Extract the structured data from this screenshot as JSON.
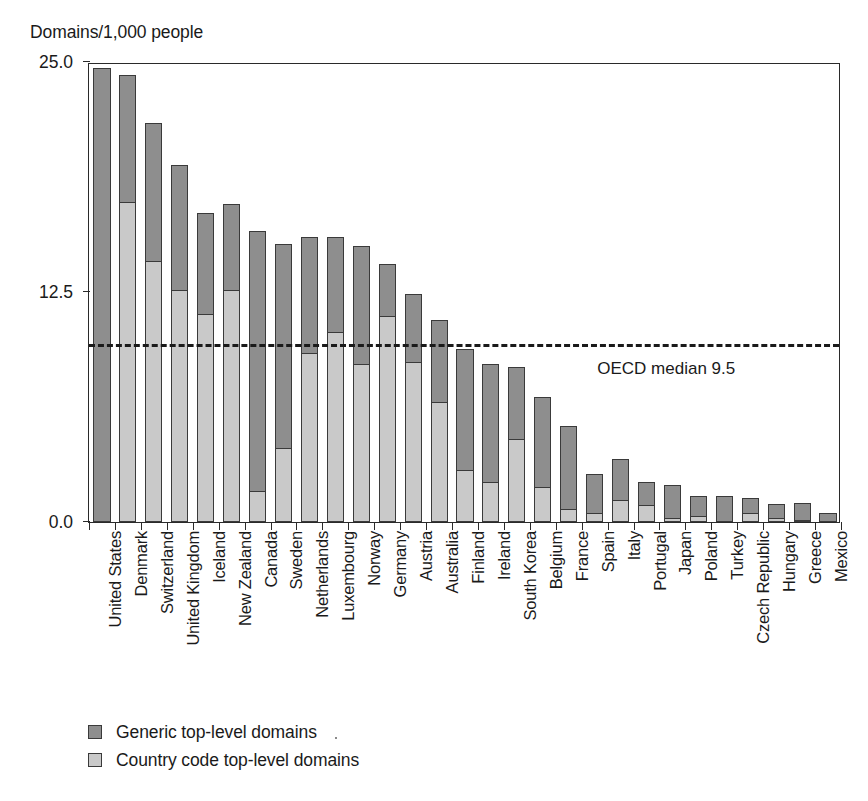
{
  "axis_title": "Domains/1,000 people",
  "colors": {
    "gtld": "#8e8e8e",
    "cctld": "#c9c9c9",
    "axis": "#2a2a2a",
    "text": "#1a1a1a"
  },
  "yaxis": {
    "ticks": [
      "0.0",
      "12.5",
      "25.0"
    ],
    "tick_values": [
      0.0,
      12.5,
      25.0
    ],
    "min": 0.0,
    "max": 25.0
  },
  "annotation": {
    "median_label": "OECD median 9.5",
    "median_value": 9.5
  },
  "legend": {
    "items": [
      {
        "label": "Generic top-level domains",
        "key": "gtld",
        "color": "#8e8e8e"
      },
      {
        "label": "Country code top-level domains",
        "key": "cctld",
        "color": "#c9c9c9"
      }
    ]
  },
  "chart_data": {
    "type": "bar",
    "subtype": "stacked-vertical",
    "title": "",
    "xlabel": "",
    "ylabel": "Domains/1,000 people",
    "ylim": [
      0.0,
      25.0
    ],
    "yticks": [
      0.0,
      12.5,
      25.0
    ],
    "grid": false,
    "legend_position": "bottom-left",
    "annotations": [
      {
        "type": "hline",
        "value": 9.5,
        "label": "OECD median 9.5",
        "style": "dashed"
      }
    ],
    "categories": [
      "United States",
      "Denmark",
      "Switzerland",
      "United Kingdom",
      "Iceland",
      "New Zealand",
      "Canada",
      "Sweden",
      "Netherlands",
      "Luxembourg",
      "Norway",
      "Germany",
      "Austria",
      "Australia",
      "Finland",
      "Ireland",
      "South Korea",
      "Belgium",
      "France",
      "Spain",
      "Italy",
      "Portugal",
      "Japan",
      "Poland",
      "Turkey",
      "Czech Republic",
      "Hungary",
      "Greece",
      "Mexico"
    ],
    "series": [
      {
        "name": "Country code top-level domains",
        "key": "cctld",
        "color": "#c9c9c9",
        "values": [
          0.0,
          17.4,
          14.2,
          12.6,
          11.3,
          12.6,
          1.7,
          4.0,
          9.2,
          10.3,
          8.6,
          11.2,
          8.7,
          6.5,
          2.8,
          2.2,
          4.5,
          1.9,
          0.7,
          0.5,
          1.2,
          0.9,
          0.2,
          0.3,
          0.0,
          0.5,
          0.2,
          0.1,
          0.0
        ]
      },
      {
        "name": "Generic top-level domains",
        "key": "gtld",
        "color": "#8e8e8e",
        "values": [
          24.7,
          6.9,
          7.5,
          6.8,
          5.5,
          4.7,
          14.1,
          11.1,
          6.3,
          5.2,
          6.4,
          2.8,
          3.7,
          4.5,
          6.6,
          6.4,
          3.9,
          4.9,
          4.5,
          2.1,
          2.2,
          1.3,
          1.8,
          1.1,
          1.4,
          0.8,
          0.8,
          0.9,
          0.5
        ]
      }
    ],
    "totals": [
      24.7,
      24.3,
      21.7,
      19.4,
      18.8,
      17.3,
      15.8,
      15.1,
      15.5,
      15.5,
      15.0,
      14.0,
      12.4,
      11.0,
      9.4,
      8.6,
      8.4,
      6.8,
      5.2,
      2.6,
      3.4,
      2.2,
      2.0,
      1.4,
      1.4,
      1.3,
      1.0,
      1.0,
      0.5
    ]
  }
}
